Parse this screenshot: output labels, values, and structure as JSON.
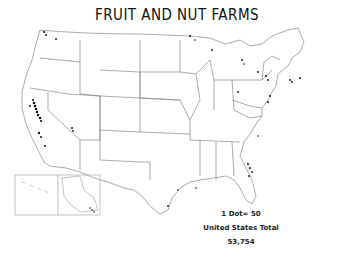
{
  "map": {
    "title": "FRUIT AND NUT FARMS",
    "legend": {
      "dot_value": "1 Dot= 50",
      "total_label": "United States Total",
      "total_value": "53,754"
    },
    "colors": {
      "outline": "#888888",
      "dots": "#111111",
      "background": "#ffffff"
    }
  }
}
